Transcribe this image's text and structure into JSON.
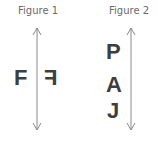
{
  "figures": [
    {
      "label": "Figure 1",
      "axis": "vertical-double-arrow",
      "letters": [
        {
          "char": "F",
          "side": "left",
          "mirrored": false
        },
        {
          "char": "F",
          "side": "right",
          "mirrored": true
        }
      ]
    },
    {
      "label": "Figure 2",
      "axis": "vertical-double-arrow",
      "letters": [
        {
          "char": "P",
          "side": "left"
        },
        {
          "char": "A",
          "side": "left"
        },
        {
          "char": "J",
          "side": "left"
        }
      ]
    }
  ],
  "colors": {
    "text": "#3e3e3e",
    "label": "#6a6a6a",
    "arrow": "#8a8a8a"
  }
}
